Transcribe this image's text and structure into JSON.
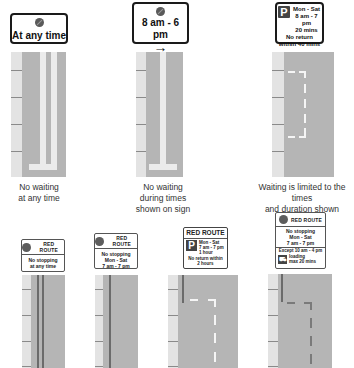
{
  "top_row": [
    {
      "sign": {
        "icon": "no-waiting-icon",
        "lines": [
          "At any time"
        ]
      },
      "marking": "double-yellow-lines",
      "caption": [
        "No waiting",
        "at any time"
      ]
    },
    {
      "sign": {
        "icon": "no-waiting-icon",
        "lines": [
          "8 am - 6 pm"
        ],
        "arrow": "→"
      },
      "marking": "single-yellow-line",
      "caption": [
        "No waiting",
        "during times",
        "shown on sign"
      ]
    },
    {
      "sign": {
        "icon": "P",
        "lines": [
          "Mon - Sat",
          "8 am - 7 pm",
          "20 mins"
        ],
        "footer": [
          "No return",
          "within 40 mins"
        ]
      },
      "marking": "parking-bay",
      "caption": [
        "Waiting is limited to the times",
        "and duration shown"
      ]
    }
  ],
  "bottom_row": [
    {
      "sign": {
        "header": "RED ROUTE",
        "lines": [
          "No stopping",
          "at any time"
        ]
      },
      "marking": "double-red-lines"
    },
    {
      "sign": {
        "header": "RED ROUTE",
        "lines": [
          "No stopping",
          "Mon - Sat",
          "7 am - 7 pm"
        ]
      },
      "marking": "single-red-line"
    },
    {
      "sign": {
        "header": "RED ROUTE",
        "icon": "P",
        "lines": [
          "Mon - Sat",
          "7 am - 7 pm",
          "1 hour"
        ],
        "footer": [
          "No return within",
          "2 hours"
        ]
      },
      "marking": "red-route-parking-bay"
    },
    {
      "sign": {
        "header": "RED ROUTE",
        "lines": [
          "No stopping",
          "Mon - Sat",
          "7 am - 7 pm"
        ],
        "except": "Except 10 am - 4 pm",
        "loading": [
          "loading",
          "max 20 mins"
        ]
      },
      "marking": "red-route-loading-bay"
    }
  ]
}
